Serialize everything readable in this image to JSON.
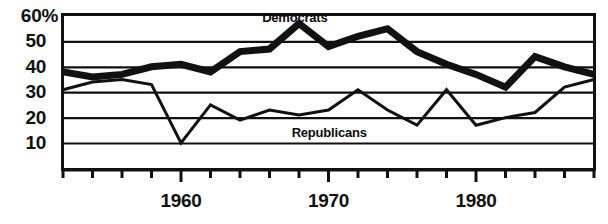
{
  "chart_data": {
    "type": "line",
    "title": "",
    "xlabel": "",
    "ylabel": "",
    "xlim": [
      1952,
      1988
    ],
    "ylim": [
      0,
      60
    ],
    "grid": true,
    "gridlines": [
      10,
      20,
      30,
      40,
      50,
      60
    ],
    "y_tick_labels": [
      "60%",
      "50",
      "40",
      "30",
      "20",
      "10"
    ],
    "x_tick_labels": [
      "1960",
      "1970",
      "1980"
    ],
    "x_tick_values": [
      1960,
      1970,
      1980
    ],
    "x_tick_interval_years": 2,
    "legend_position": "inline-annotation",
    "series": [
      {
        "name": "Democrats",
        "label": "Democrats",
        "color": "#111111",
        "style": "thick",
        "x": [
          1952,
          1954,
          1956,
          1958,
          1960,
          1962,
          1964,
          1966,
          1968,
          1970,
          1972,
          1974,
          1976,
          1978,
          1980,
          1982,
          1984,
          1986,
          1988
        ],
        "values": [
          38,
          36,
          37,
          40,
          41,
          38,
          46,
          47,
          57,
          48,
          52,
          55,
          46,
          41,
          37,
          32,
          44,
          40,
          37
        ]
      },
      {
        "name": "Republicans",
        "label": "Republicans",
        "color": "#111111",
        "style": "thin",
        "x": [
          1952,
          1954,
          1956,
          1958,
          1960,
          1962,
          1964,
          1966,
          1968,
          1970,
          1972,
          1974,
          1976,
          1978,
          1980,
          1982,
          1984,
          1986,
          1988
        ],
        "values": [
          31,
          34,
          35,
          33,
          10,
          25,
          19,
          23,
          21,
          23,
          31,
          23,
          17,
          31,
          17,
          20,
          22,
          32,
          35
        ]
      }
    ],
    "annotations": [
      {
        "text": "Democrats",
        "x": 1965.5,
        "y": 59.5
      },
      {
        "text": "Republicans",
        "x": 1967.5,
        "y": 14.5
      }
    ]
  }
}
